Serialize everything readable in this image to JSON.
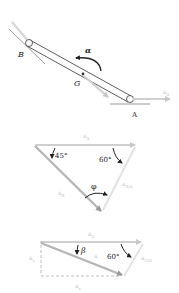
{
  "figure_top": {
    "labels": {
      "point_b": "B",
      "point_g": "G",
      "point_a": "A",
      "alpha": "α",
      "a_a": "a",
      "a_a_sub": "A"
    }
  },
  "figure_mid": {
    "labels": {
      "a_a": "a",
      "a_a_sub": "A",
      "angle_45": "45°",
      "angle_60": "60°",
      "phi": "φ",
      "a_b": "a",
      "a_b_sub": "B",
      "a_ba": "a",
      "a_ba_sub": "B/A"
    }
  },
  "figure_bot": {
    "labels": {
      "a_a": "a",
      "a_a_sub": "A",
      "beta": "β",
      "angle_60": "60°",
      "a": "a",
      "a_ga": "a",
      "a_ga_sub": "G/A",
      "a_y": "a",
      "a_y_sub": "y",
      "a_x": "a",
      "a_x_sub": "x"
    }
  },
  "colors": {
    "rod": "#333333",
    "vector": "#c8c8c8",
    "vector_dark": "#a8a8a8",
    "text": "#222222"
  }
}
